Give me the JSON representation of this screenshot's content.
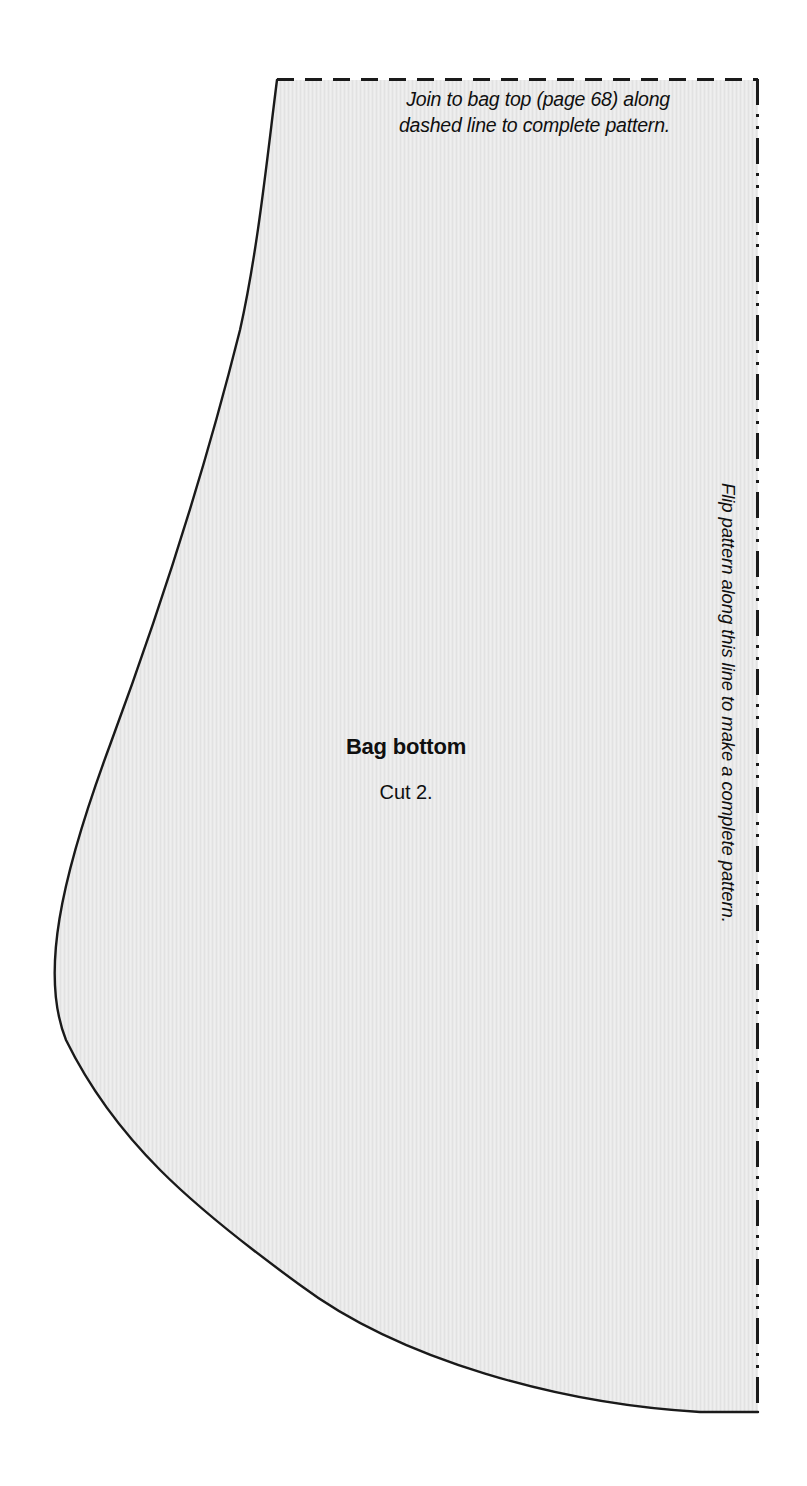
{
  "sheet": {
    "width": 807,
    "height": 1486,
    "background_color": "#ffffff"
  },
  "pattern_piece": {
    "name": "Bag bottom",
    "cut_instruction": "Cut 2.",
    "fill_color": "#e9e9e9",
    "outline_color": "#1a1a1a"
  },
  "notes": {
    "join_note": "Join to bag top (page 68) along\ndashed line to complete pattern.",
    "flip_note": "Flip pattern along this line to make a complete pattern."
  },
  "edges": {
    "top_edge": {
      "style": "dashed",
      "label": "join-to-bag-top-dashed-edge",
      "color": "#1a1a1a"
    },
    "right_edge": {
      "style": "dash-dot-dot",
      "label": "fold-line-edge",
      "color": "#1a1a1a"
    },
    "curved_edge": {
      "style": "solid",
      "label": "cutting-line-edge",
      "color": "#1a1a1a"
    }
  }
}
